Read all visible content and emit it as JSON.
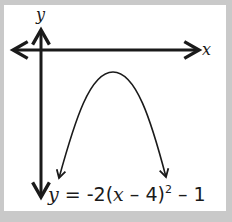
{
  "diagram": {
    "type": "parabola-graph",
    "axes": {
      "x_label": "x",
      "y_label": "y"
    },
    "equation": {
      "lhs": "y",
      "equals": " = ",
      "part1": "-2(",
      "x": "x",
      "part2": " – 4)",
      "exponent": "2",
      "part3": " – 1"
    },
    "curve": {
      "opens": "down",
      "vertex": [
        4,
        -1
      ],
      "a": -2
    },
    "colors": {
      "frame": "#c9c9c9",
      "background": "#ffffff",
      "ink": "#1a1a1a"
    }
  }
}
